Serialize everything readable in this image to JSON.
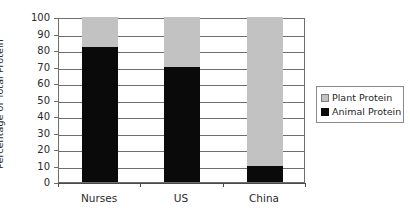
{
  "chart_data": {
    "type": "bar",
    "stacked": true,
    "stacked_mode": "percent",
    "title": "",
    "subtitle": "",
    "xlabel": "",
    "ylabel": "Percentage of Total Protein",
    "categories": [
      "Nurses",
      "US",
      "China"
    ],
    "series": [
      {
        "name": "Animal Protein",
        "values": [
          82,
          70,
          10
        ],
        "color": "#0a0a0a"
      },
      {
        "name": "Plant Protein",
        "values": [
          18,
          30,
          90
        ],
        "color": "#c2c2c2"
      }
    ],
    "stack_order_bottom_to_top": [
      "Animal Protein",
      "Plant Protein"
    ],
    "ylim": [
      0,
      100
    ],
    "ytick_step": 10,
    "ytick_labels": [
      "100",
      "90",
      "80",
      "70",
      "60",
      "50",
      "40",
      "30",
      "20",
      "10",
      "0"
    ],
    "ytick_values": [
      100,
      90,
      80,
      70,
      60,
      50,
      40,
      30,
      20,
      10,
      0
    ],
    "grid": {
      "horizontal": true,
      "vertical": false
    },
    "legend": {
      "position": "right",
      "bordered": true,
      "entries": [
        {
          "label": "Plant Protein",
          "swatch": "plant"
        },
        {
          "label": "Animal Protein",
          "swatch": "animal"
        }
      ]
    },
    "plot_border": true,
    "colors": {
      "animal_protein": "#0a0a0a",
      "plant_protein": "#c2c2c2",
      "axis": "#6e6e6e",
      "text": "#2b2b2b",
      "background": "#ffffff"
    }
  }
}
